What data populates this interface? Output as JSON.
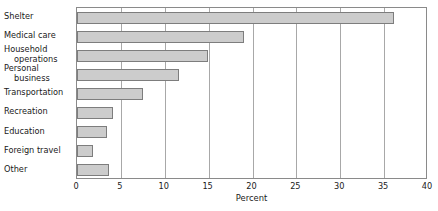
{
  "chart_data": {
    "type": "bar",
    "orientation": "horizontal",
    "title": "",
    "xlabel": "Percent",
    "ylabel": "",
    "xlim": [
      0,
      40
    ],
    "xticks": [
      0,
      5,
      10,
      15,
      20,
      25,
      30,
      35,
      40
    ],
    "xtick_labels": [
      "0",
      "5",
      "10",
      "15",
      "20",
      "25",
      "30",
      "35",
      "40"
    ],
    "grid": "vertical",
    "legend": "none",
    "bar_fill_color": "#cccccc",
    "bar_edge_color": "#7d7d7d",
    "categories": [
      "Shelter",
      "Medical care",
      "Household operations",
      "Personal business",
      "Transportation",
      "Recreation",
      "Education",
      "Foreign travel",
      "Other"
    ],
    "values": [
      36.1,
      19.0,
      14.9,
      11.6,
      7.5,
      4.1,
      3.4,
      1.8,
      3.6
    ]
  },
  "labels": {
    "rows": [
      {
        "line1": "Shelter",
        "line2": ""
      },
      {
        "line1": "Medical care",
        "line2": ""
      },
      {
        "line1": "Household",
        "line2": "operations"
      },
      {
        "line1": "Personal",
        "line2": "business"
      },
      {
        "line1": "Transportation",
        "line2": ""
      },
      {
        "line1": "Recreation",
        "line2": ""
      },
      {
        "line1": "Education",
        "line2": ""
      },
      {
        "line1": "Foreign travel",
        "line2": ""
      },
      {
        "line1": "Other",
        "line2": ""
      }
    ]
  }
}
